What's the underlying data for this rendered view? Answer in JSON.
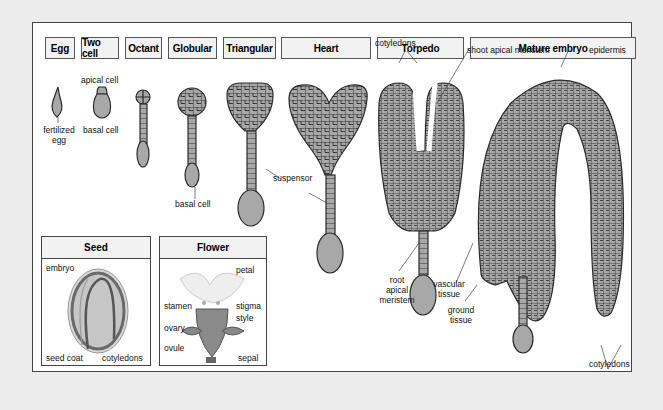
{
  "stages": [
    {
      "label": "Egg"
    },
    {
      "label": "Two cell"
    },
    {
      "label": "Octant"
    },
    {
      "label": "Globular"
    },
    {
      "label": "Triangular"
    },
    {
      "label": "Heart"
    },
    {
      "label": "Torpedo"
    },
    {
      "label": "Mature embryo"
    }
  ],
  "labels": {
    "apical_cell": "apical cell",
    "fertilized": "fertilized",
    "egg": "egg",
    "basal_cell_1": "basal cell",
    "basal_cell_2": "basal cell",
    "suspensor": "suspensor",
    "cotyledons_top": "cotyledons",
    "shoot_apical_meristem": "shoot apical meristem",
    "epidermis": "epidermis",
    "root": "root",
    "apical": "apical",
    "meristem": "meristem",
    "vascular": "vascular",
    "tissue_v": "tissue",
    "ground": "ground",
    "tissue_g": "tissue",
    "cotyledons_bottom": "cotyledons"
  },
  "seed_inset": {
    "title": "Seed",
    "labels": {
      "embryo": "embryo",
      "seed_coat": "seed coat",
      "cotyledons": "cotyledons"
    }
  },
  "flower_inset": {
    "title": "Flower",
    "labels": {
      "petal": "petal",
      "stamen": "stamen",
      "stigma": "stigma",
      "style": "style",
      "ovary": "ovary",
      "ovule": "ovule",
      "sepal": "sepal"
    }
  },
  "colors": {
    "background": "#ececec",
    "panel": "#ffffff",
    "cell_fill": "#a8a8a8",
    "cell_line": "#2a2a2a",
    "header_fill": "#f2f2f2"
  }
}
